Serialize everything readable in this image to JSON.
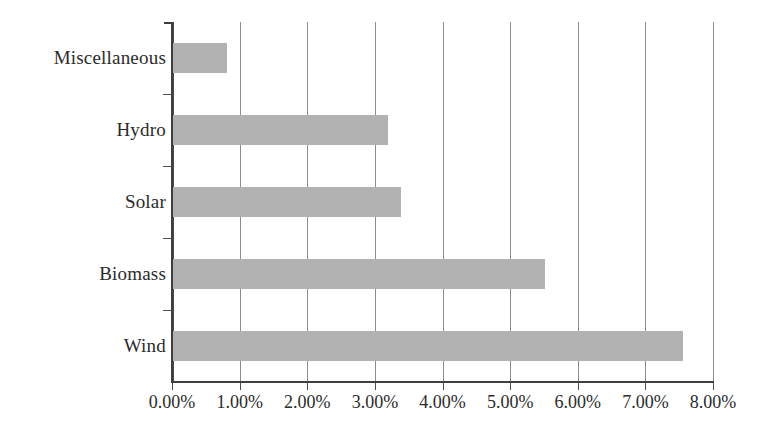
{
  "chart_data": {
    "type": "bar",
    "orientation": "horizontal",
    "title": "",
    "subtitle": "",
    "xlabel": "",
    "ylabel": "",
    "categories": [
      "Miscellaneous",
      "Hydro",
      "Solar",
      "Biomass",
      "Wind"
    ],
    "values": [
      0.81,
      3.19,
      3.38,
      5.52,
      7.56
    ],
    "value_labels": [
      "0.81%",
      "3.19%",
      "3.38%",
      "5.52%",
      "7.56%"
    ],
    "series": [
      {
        "name": "Share",
        "values": [
          0.81,
          3.19,
          3.38,
          5.52,
          7.56
        ]
      }
    ],
    "xlim": [
      0,
      8
    ],
    "ylim": null,
    "xticks": [
      0,
      1,
      2,
      3,
      4,
      5,
      6,
      7,
      8
    ],
    "xticklabels": [
      "0.00%",
      "1.00%",
      "2.00%",
      "3.00%",
      "4.00%",
      "5.00%",
      "6.00%",
      "7.00%",
      "8.00%"
    ],
    "yticklabels": [
      "Miscellaneous",
      "Hydro",
      "Solar",
      "Biomass",
      "Wind"
    ],
    "grid": {
      "vertical": true,
      "horizontal": false
    },
    "legend": {
      "visible": false,
      "position": "none",
      "entries": []
    },
    "annotations": [],
    "colors": {
      "bar_fill": "#b2b2b2",
      "gridline": "#8d8d8d",
      "axis": "#3f3f3f",
      "text": "#2b2b2b",
      "background": "#ffffff"
    }
  }
}
